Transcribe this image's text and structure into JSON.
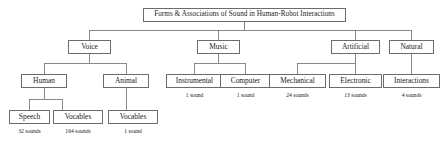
{
  "diagram": {
    "type": "tree",
    "title": "Forms & Associations of Sound in Human-Robot Interactions",
    "root": {
      "label": "Forms & Associations of Sound in Human-Robot Interactions"
    },
    "level2": {
      "voice": "Voice",
      "music": "Music",
      "artificial": "Artificial",
      "natural": "Natural"
    },
    "level3": {
      "human": "Human",
      "animal": "Animal",
      "instrumental": "Instrumental",
      "computer": "Computer",
      "mechanical": "Mechanical",
      "electronic": "Electronic",
      "interactions": "Interactions"
    },
    "level4": {
      "speech": "Speech",
      "human_vocables": "Vocables",
      "animal_vocables": "Vocables"
    },
    "counts": {
      "instrumental": "1 sound",
      "computer": "1 sound",
      "mechanical": "24 sounds",
      "electronic": "13 sounds",
      "interactions": "4 sounds",
      "speech": "32 sounds",
      "human_vocables": "164 sounds",
      "animal_vocables": "1 sound"
    },
    "colors": {
      "box_border": "#6b6b6b",
      "edge": "#6b6b6b",
      "text": "#1a1a1a",
      "background": "#ffffff"
    }
  }
}
